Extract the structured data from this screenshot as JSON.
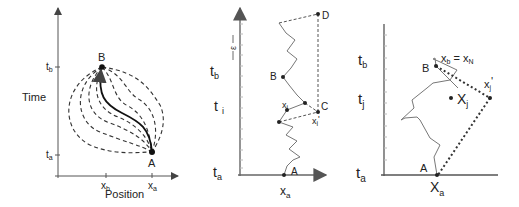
{
  "panel1": {
    "y_axis_label": "Time",
    "x_axis_label": "Position",
    "tick_tb": "t",
    "tick_tb_sub": "b",
    "tick_ta": "t",
    "tick_ta_sub": "a",
    "tick_xb": "x",
    "tick_xb_sub": "b",
    "tick_xa": "x",
    "tick_xa_sub": "a",
    "point_B": "B",
    "point_A": "A"
  },
  "panel2": {
    "epsilon": "ε",
    "tick_tb": "t",
    "tick_tb_sub": "b",
    "tick_ti": "t",
    "tick_ti_sub": "i",
    "tick_ta": "t",
    "tick_ta_sub": "a",
    "tick_xa": "x",
    "tick_xa_sub": "a",
    "point_D": "D",
    "point_B": "B",
    "point_C": "C",
    "point_A": "A",
    "label_xi": "x",
    "label_xi_sub": "i",
    "label_xip": "x",
    "label_xip_sub": "i",
    "label_xip_prime": "'"
  },
  "panel3": {
    "tick_tb": "t",
    "tick_tb_sub": "b",
    "tick_tj": "t",
    "tick_tj_sub": "j",
    "tick_ta": "t",
    "tick_ta_sub": "a",
    "tick_xa": "X",
    "tick_xa_sub": "a",
    "point_B": "B",
    "point_A": "A",
    "label_eq_left": "x",
    "label_eq_left_sub": "b",
    "label_eq_mid": " = x",
    "label_eq_right_sub": "N",
    "label_xj": "X",
    "label_xj_sub": "j",
    "label_xjp": "x",
    "label_xjp_sub": "j",
    "label_xjp_prime": "'"
  }
}
